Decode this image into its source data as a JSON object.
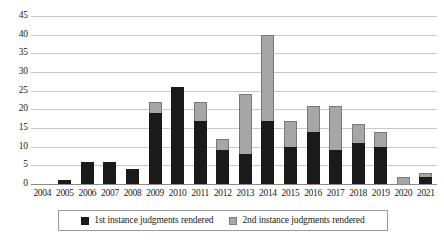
{
  "chart_data": {
    "type": "bar",
    "title": "",
    "subtitle": "",
    "xlabel": "",
    "ylabel": "",
    "stacked": true,
    "grid": true,
    "legend_position": "bottom",
    "ylim": [
      0,
      45
    ],
    "ytick_step": 5,
    "ytick_labels": [
      "0",
      "5",
      "10",
      "15",
      "20",
      "25",
      "30",
      "35",
      "40",
      "45"
    ],
    "ytick_values": [
      0,
      5,
      10,
      15,
      20,
      25,
      30,
      35,
      40,
      45
    ],
    "categories": [
      "2004",
      "2005",
      "2006",
      "2007",
      "2008",
      "2009",
      "2010",
      "2011",
      "2012",
      "2013",
      "2014",
      "2015",
      "2016",
      "2017",
      "2018",
      "2019",
      "2020",
      "2021"
    ],
    "series": [
      {
        "name": "1st instance judgments rendered",
        "color": "#1a1a1a",
        "values": [
          0,
          1,
          6,
          6,
          4,
          19,
          26,
          17,
          9,
          8,
          17,
          10,
          14,
          9,
          11,
          10,
          0,
          2
        ]
      },
      {
        "name": "2nd instance judgments rendered",
        "color": "#a6a6a6",
        "values": [
          0,
          0,
          0,
          0,
          0,
          3,
          0,
          5,
          3,
          16,
          23,
          7,
          7,
          12,
          5,
          4,
          2,
          1
        ]
      }
    ],
    "totals": [
      0,
      1,
      6,
      6,
      4,
      22,
      26,
      22,
      12,
      24,
      40,
      17,
      21,
      21,
      16,
      14,
      2,
      3
    ]
  },
  "legend": {
    "items": [
      {
        "label": "1st instance judgments rendered",
        "swatch": "first-instance-swatch"
      },
      {
        "label": "2nd instance judgments rendered",
        "swatch": "second-instance-swatch"
      }
    ]
  },
  "colors": {
    "first_instance": "#1a1a1a",
    "second_instance": "#a6a6a6",
    "gridline": "#c8c8c8",
    "axis": "#8a8a8a",
    "background": "#ffffff"
  }
}
